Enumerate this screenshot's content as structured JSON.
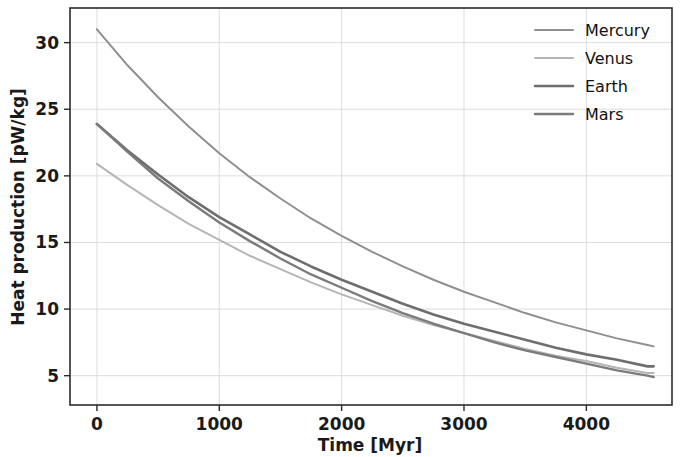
{
  "figure": {
    "background_color": "#ffffff",
    "axes_frame_color": "#2b2b2b",
    "grid_color": "#d8d8d8"
  },
  "chart_data": {
    "type": "line",
    "title": "",
    "xlabel": "Time [Myr]",
    "ylabel": "Heat production [pW/kg]",
    "xlim": [
      -220,
      4700
    ],
    "ylim": [
      2.8,
      32.6
    ],
    "xticks": [
      0,
      1000,
      2000,
      3000,
      4000
    ],
    "xticklabels": [
      "0",
      "1000",
      "2000",
      "3000",
      "4000"
    ],
    "yticks": [
      5,
      10,
      15,
      20,
      25,
      30
    ],
    "yticklabels": [
      "5",
      "10",
      "15",
      "20",
      "25",
      "30"
    ],
    "grid": true,
    "grid_axis": "both",
    "legend_position": "upper right",
    "legend_frame": false,
    "x": [
      0,
      250,
      500,
      750,
      1000,
      1250,
      1500,
      1750,
      2000,
      2250,
      2500,
      2750,
      3000,
      3250,
      3500,
      3750,
      4000,
      4250,
      4500,
      4550
    ],
    "series": [
      {
        "name": "Mercury",
        "color": "#8f8f8f",
        "linewidth": 2.0,
        "values": [
          31.0,
          28.3,
          25.9,
          23.7,
          21.7,
          19.9,
          18.3,
          16.8,
          15.5,
          14.3,
          13.2,
          12.2,
          11.3,
          10.5,
          9.7,
          9.0,
          8.4,
          7.8,
          7.3,
          7.2
        ]
      },
      {
        "name": "Venus",
        "color": "#b5b5b5",
        "linewidth": 2.0,
        "values": [
          20.9,
          19.3,
          17.8,
          16.4,
          15.2,
          14.0,
          13.0,
          12.0,
          11.1,
          10.3,
          9.5,
          8.8,
          8.2,
          7.6,
          7.0,
          6.5,
          6.1,
          5.6,
          5.2,
          5.2
        ]
      },
      {
        "name": "Earth",
        "color": "#6e6e6e",
        "linewidth": 2.6,
        "values": [
          23.9,
          21.9,
          20.1,
          18.4,
          16.9,
          15.6,
          14.3,
          13.2,
          12.2,
          11.3,
          10.4,
          9.6,
          8.9,
          8.3,
          7.7,
          7.1,
          6.6,
          6.2,
          5.7,
          5.7
        ]
      },
      {
        "name": "Mars",
        "color": "#7b7b7b",
        "linewidth": 2.4,
        "values": [
          23.9,
          21.8,
          19.8,
          18.1,
          16.5,
          15.1,
          13.8,
          12.6,
          11.6,
          10.6,
          9.7,
          8.9,
          8.2,
          7.5,
          6.9,
          6.4,
          5.9,
          5.4,
          5.0,
          4.9
        ]
      }
    ]
  },
  "legend": {
    "items": [
      {
        "label": "Mercury"
      },
      {
        "label": "Venus"
      },
      {
        "label": "Earth"
      },
      {
        "label": "Mars"
      }
    ]
  }
}
